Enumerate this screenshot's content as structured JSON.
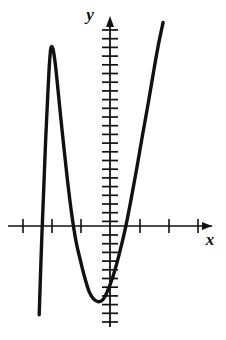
{
  "figure": {
    "kind": "cartesian-plot",
    "background_color": "#ffffff",
    "ink_color": "#111111",
    "axis_labels": {
      "x": "x",
      "y": "y"
    }
  },
  "chart_data": {
    "type": "line",
    "title": "",
    "xlabel": "x",
    "ylabel": "y",
    "grid": false,
    "legend": null,
    "axes": {
      "x_axis_y_pixel": 226,
      "y_axis_x_pixel": 110,
      "x_tick_spacing_px": 29.5,
      "y_tick_spacing_px": 8.7,
      "x_tick_count_visible": 7,
      "y_tick_count_visible": 34,
      "x_arrow": true,
      "y_arrow": true,
      "xlim": [
        -3.7,
        4.0
      ],
      "ylim": [
        -11.5,
        22.5
      ]
    },
    "curve_description": "cubic-like polynomial with local maximum on the left and local minimum near the origin, three x-intercepts",
    "features": {
      "local_maximum": {
        "x": -2.0,
        "y": 20.5
      },
      "local_minimum": {
        "x": -0.35,
        "y": -8.7
      },
      "x_intercepts": [
        -2.95,
        -0.95,
        1.02
      ],
      "left_branch_end": {
        "x": -2.4,
        "y": -10.2
      },
      "right_branch_end": {
        "x": 1.8,
        "y": 23.4
      }
    },
    "points": [
      {
        "x": -2.4,
        "y": -10.2
      },
      {
        "x": -2.33,
        "y": -3.0
      },
      {
        "x": -2.25,
        "y": 4.0
      },
      {
        "x": -2.18,
        "y": 10.0
      },
      {
        "x": -2.11,
        "y": 15.0
      },
      {
        "x": -2.05,
        "y": 18.8
      },
      {
        "x": -2.0,
        "y": 20.5
      },
      {
        "x": -1.93,
        "y": 20.3
      },
      {
        "x": -1.85,
        "y": 18.5
      },
      {
        "x": -1.75,
        "y": 15.2
      },
      {
        "x": -1.6,
        "y": 10.2
      },
      {
        "x": -1.45,
        "y": 5.5
      },
      {
        "x": -1.3,
        "y": 1.4
      },
      {
        "x": -1.15,
        "y": -1.8
      },
      {
        "x": -1.0,
        "y": -4.0
      },
      {
        "x": -0.85,
        "y": -6.0
      },
      {
        "x": -0.7,
        "y": -7.6
      },
      {
        "x": -0.55,
        "y": -8.4
      },
      {
        "x": -0.4,
        "y": -8.7
      },
      {
        "x": -0.25,
        "y": -8.5
      },
      {
        "x": -0.1,
        "y": -7.6
      },
      {
        "x": 0.1,
        "y": -5.8
      },
      {
        "x": 0.3,
        "y": -3.4
      },
      {
        "x": 0.5,
        "y": -0.6
      },
      {
        "x": 0.7,
        "y": 2.8
      },
      {
        "x": 0.9,
        "y": 6.5
      },
      {
        "x": 1.1,
        "y": 10.4
      },
      {
        "x": 1.3,
        "y": 14.2
      },
      {
        "x": 1.5,
        "y": 18.2
      },
      {
        "x": 1.65,
        "y": 21.0
      },
      {
        "x": 1.8,
        "y": 23.4
      }
    ]
  }
}
